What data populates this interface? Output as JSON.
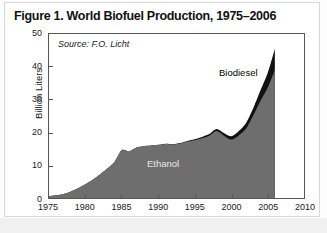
{
  "figure": {
    "title": "Figure 1. World Biofuel Production, 1975–2006",
    "source_note": "Source: F.O. Licht"
  },
  "colors": {
    "ethanol_fill": "#6e6e6e",
    "biodiesel_fill": "#111111",
    "plot_border": "#555555",
    "figure_background": "#fdfdfd",
    "plot_background": "#ffffff",
    "ethanol_label_text": "#e8e8e8",
    "biodiesel_label_text": "#000000"
  },
  "axes": {
    "y_label": "Billion Liters",
    "y_ticks": [
      "0",
      "10",
      "20",
      "30",
      "40",
      "50"
    ],
    "x_ticks": [
      "1975",
      "1980",
      "1985",
      "1990",
      "1995",
      "2000",
      "2005",
      "2010"
    ]
  },
  "series_labels": {
    "ethanol": "Ethanol",
    "biodiesel": "Biodiesel"
  },
  "chart_data": {
    "type": "area",
    "stacked": true,
    "title": "Figure 1. World Biofuel Production, 1975–2006",
    "subtitle": "",
    "xlabel": "",
    "ylabel": "Billion Liters",
    "units": "billion liters",
    "annotations": [
      "Source: F.O. Licht"
    ],
    "xlim": [
      1975,
      2010
    ],
    "ylim": [
      0,
      50
    ],
    "y_tick_step": 10,
    "x_tick_step": 5,
    "grid": false,
    "legend": "inline-labels",
    "data_end_year": 2006,
    "x": [
      1975,
      1976,
      1977,
      1978,
      1979,
      1980,
      1981,
      1982,
      1983,
      1984,
      1985,
      1986,
      1987,
      1988,
      1989,
      1990,
      1991,
      1992,
      1993,
      1994,
      1995,
      1996,
      1997,
      1998,
      1999,
      2000,
      2001,
      2002,
      2003,
      2004,
      2005,
      2006
    ],
    "series": [
      {
        "name": "Ethanol",
        "color": "#6e6e6e",
        "values": [
          0.5,
          0.8,
          1.2,
          2.0,
          3.0,
          4.2,
          5.6,
          7.2,
          9.0,
          11.0,
          14.6,
          14.2,
          15.4,
          15.8,
          16.0,
          16.2,
          16.5,
          16.3,
          16.6,
          17.2,
          17.6,
          18.2,
          19.0,
          20.4,
          19.0,
          17.8,
          19.0,
          21.0,
          25.0,
          29.5,
          33.5,
          39.0
        ]
      },
      {
        "name": "Biodiesel",
        "color": "#111111",
        "values": [
          0.0,
          0.0,
          0.0,
          0.0,
          0.0,
          0.0,
          0.0,
          0.0,
          0.0,
          0.0,
          0.0,
          0.0,
          0.0,
          0.0,
          0.0,
          0.0,
          0.05,
          0.1,
          0.15,
          0.2,
          0.3,
          0.4,
          0.5,
          0.6,
          0.8,
          1.0,
          1.3,
          1.7,
          2.2,
          3.2,
          4.5,
          6.5
        ]
      }
    ],
    "totals": [
      0.5,
      0.8,
      1.2,
      2.0,
      3.0,
      4.2,
      5.6,
      7.2,
      9.0,
      11.0,
      14.6,
      14.2,
      15.4,
      15.8,
      16.0,
      16.2,
      16.55,
      16.4,
      16.75,
      17.4,
      17.9,
      18.6,
      19.5,
      21.0,
      19.8,
      18.8,
      20.3,
      22.7,
      27.2,
      32.7,
      38.0,
      45.5
    ]
  }
}
